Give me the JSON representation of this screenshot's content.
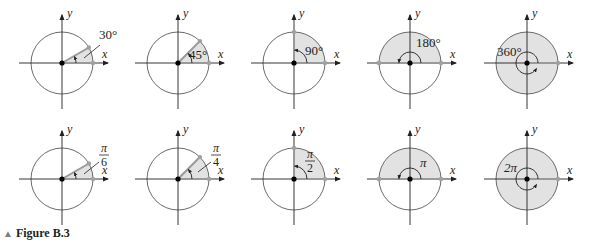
{
  "figure": {
    "caption_marker": "▲",
    "caption": "Figure B.3",
    "axis_labels": {
      "x": "x",
      "y": "y"
    },
    "colors": {
      "circle": "#5a5a5a",
      "axis": "#231f20",
      "sector_fill": "#e2e2e2",
      "terminal_ray": "#9a9a9a",
      "point": "#a0a0a0",
      "origin": "#000000"
    },
    "rows": [
      {
        "unit": "degrees",
        "panels": [
          {
            "angle_deg": 30,
            "label": "30°"
          },
          {
            "angle_deg": 45,
            "label": "45°"
          },
          {
            "angle_deg": 90,
            "label": "90°"
          },
          {
            "angle_deg": 180,
            "label": "180°"
          },
          {
            "angle_deg": 360,
            "label": "360°"
          }
        ]
      },
      {
        "unit": "radians",
        "panels": [
          {
            "angle_deg": 30,
            "label_num": "π",
            "label_den": "6"
          },
          {
            "angle_deg": 45,
            "label_num": "π",
            "label_den": "4"
          },
          {
            "angle_deg": 90,
            "label_num": "π",
            "label_den": "2"
          },
          {
            "angle_deg": 180,
            "label": "π"
          },
          {
            "angle_deg": 360,
            "label": "2π"
          }
        ]
      }
    ]
  },
  "chart_data": {
    "type": "diagram",
    "title": "Figure B.3",
    "x": [
      "30°",
      "45°",
      "90°",
      "180°",
      "360°"
    ],
    "series": [
      {
        "name": "degrees",
        "values": [
          30,
          45,
          90,
          180,
          360
        ],
        "labels": [
          "30°",
          "45°",
          "90°",
          "180°",
          "360°"
        ]
      },
      {
        "name": "radians",
        "values": [
          0.5236,
          0.7854,
          1.5708,
          3.1416,
          6.2832
        ],
        "labels": [
          "π/6",
          "π/4",
          "π/2",
          "π",
          "2π"
        ]
      }
    ],
    "xlabel": "x",
    "ylabel": "y"
  }
}
